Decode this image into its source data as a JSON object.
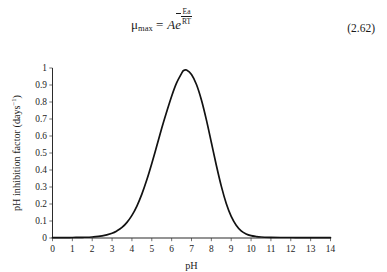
{
  "equation": {
    "lhs_symbol": "μ",
    "lhs_subscript": "max",
    "equals": "=",
    "coefficient": "A",
    "exponential_base": "e",
    "exponent_numerator": "Ea",
    "exponent_denominator": "RT",
    "exponent_sign": "−",
    "number": "(2.62)",
    "plain_text": "μmax = Ae^(−Ea/RT)"
  },
  "chart_data": {
    "type": "line",
    "title": "",
    "xlabel": "pH",
    "ylabel": "pH inhibition factor (days⁻¹)",
    "ylabel_main": "pH inhibition factor (days",
    "ylabel_sup": "−1",
    "ylabel_tail": ")",
    "xlim": [
      0,
      14
    ],
    "ylim": [
      0,
      1
    ],
    "grid": false,
    "legend": "none",
    "xticks": [
      "0",
      "1",
      "2",
      "3",
      "4",
      "5",
      "6",
      "7",
      "8",
      "9",
      "10",
      "11",
      "12",
      "13",
      "14"
    ],
    "yticks": [
      "0",
      "0.1",
      "0.2",
      "0.3",
      "0.4",
      "0.5",
      "0.6",
      "0.7",
      "0.8",
      "0.9",
      "1"
    ],
    "peak": {
      "x": 6.6,
      "y": 0.99
    },
    "series": [
      {
        "name": "pH inhibition factor",
        "color": "#121212",
        "x": [
          0,
          0.5,
          1,
          1.5,
          2,
          2.5,
          3,
          3.25,
          3.5,
          3.75,
          4,
          4.25,
          4.5,
          4.75,
          5,
          5.25,
          5.5,
          5.75,
          6,
          6.25,
          6.5,
          6.6,
          6.75,
          7,
          7.25,
          7.5,
          7.75,
          8,
          8.25,
          8.5,
          8.75,
          9,
          9.25,
          9.5,
          9.75,
          10,
          10.25,
          10.5,
          11,
          11.5,
          12,
          12.5,
          13,
          13.5,
          14
        ],
        "y": [
          0.002,
          0.002,
          0.003,
          0.004,
          0.006,
          0.012,
          0.028,
          0.042,
          0.062,
          0.092,
          0.133,
          0.188,
          0.258,
          0.342,
          0.438,
          0.541,
          0.645,
          0.742,
          0.834,
          0.912,
          0.968,
          0.985,
          0.988,
          0.962,
          0.903,
          0.812,
          0.695,
          0.562,
          0.428,
          0.305,
          0.203,
          0.127,
          0.075,
          0.042,
          0.024,
          0.014,
          0.009,
          0.006,
          0.004,
          0.003,
          0.003,
          0.002,
          0.002,
          0.002,
          0.002
        ]
      }
    ]
  }
}
